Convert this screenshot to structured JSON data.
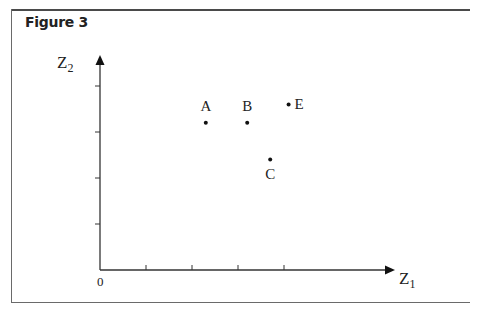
{
  "figure": {
    "title": "Figure 3"
  },
  "chart_data": {
    "type": "scatter",
    "title": "Figure 3",
    "xlabel": "Z1",
    "ylabel": "Z2",
    "origin_label": "0",
    "xlim": [
      0,
      6.5
    ],
    "ylim": [
      0,
      4.7
    ],
    "x_ticks": [
      1,
      2,
      3,
      4
    ],
    "y_ticks": [
      1,
      2,
      3,
      4
    ],
    "tick_labels_shown": false,
    "grid": false,
    "legend": null,
    "points": [
      {
        "label": "A",
        "x": 2.3,
        "y": 3.2,
        "label_position": "above"
      },
      {
        "label": "B",
        "x": 3.2,
        "y": 3.2,
        "label_position": "above"
      },
      {
        "label": "C",
        "x": 3.7,
        "y": 2.4,
        "label_position": "below"
      },
      {
        "label": "E",
        "x": 4.1,
        "y": 3.6,
        "label_position": "right"
      }
    ]
  },
  "axes": {
    "x_label_main": "Z",
    "x_label_sub": "1",
    "y_label_main": "Z",
    "y_label_sub": "2",
    "origin": "0"
  }
}
